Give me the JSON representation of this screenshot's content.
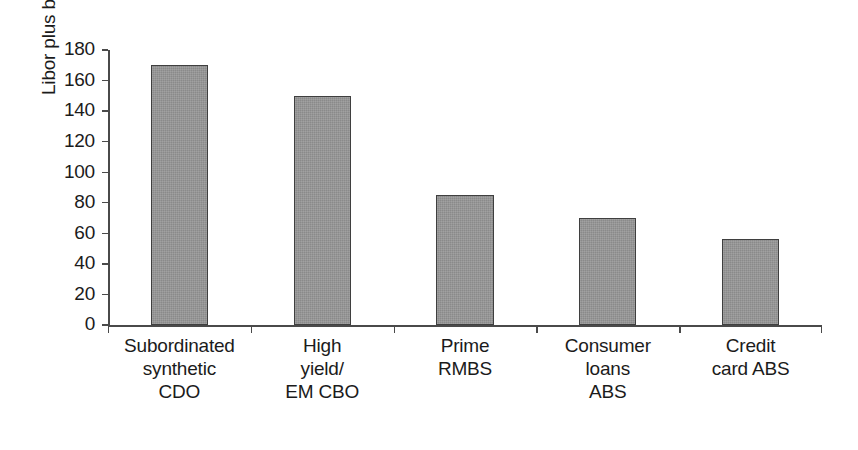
{
  "figure": {
    "background_color": "#ffffff",
    "frame_color": "#5a5a5a",
    "axis_color": "#4a4a4a",
    "bar_fill_color": "#8a8a8a",
    "bar_edge_color": "#3f3f3f",
    "text_color": "#1b1b1b"
  },
  "chart_data": {
    "type": "bar",
    "title": "",
    "subtitle": "",
    "xlabel": "",
    "ylabel": "Libor plus bps",
    "ylim": [
      0,
      180
    ],
    "ytick_values": [
      0,
      20,
      40,
      60,
      80,
      100,
      120,
      140,
      160,
      180
    ],
    "ytick_labels": [
      "0",
      "20",
      "40",
      "60",
      "80",
      "100",
      "120",
      "140",
      "160",
      "180"
    ],
    "grid": false,
    "legend": null,
    "legend_position": "none",
    "annotations": [],
    "categories": [
      "Subordinated\nsynthetic\nCDO",
      "High\nyield/\nEM CBO",
      "Prime\nRMBS",
      "Consumer\nloans\nABS",
      "Credit\ncard ABS"
    ],
    "values": [
      170,
      150,
      85,
      70,
      56
    ],
    "series": [
      {
        "name": "Libor plus bps",
        "values": [
          170,
          150,
          85,
          70,
          56
        ]
      }
    ]
  }
}
